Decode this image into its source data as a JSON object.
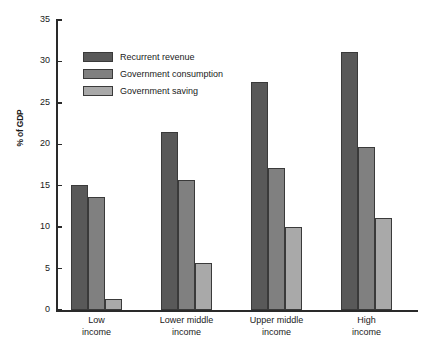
{
  "chart_data": {
    "type": "bar",
    "title": "",
    "xlabel": "",
    "ylabel": "% of GDP",
    "ylim": [
      0,
      35
    ],
    "yticks": [
      0,
      5,
      10,
      15,
      20,
      25,
      30,
      35
    ],
    "grid": false,
    "legend_position": "top-left",
    "categories": [
      "Low income",
      "Lower middle income",
      "Upper middle income",
      "High income"
    ],
    "category_lines": [
      [
        "Low",
        "income"
      ],
      [
        "Lower middle",
        "income"
      ],
      [
        "Upper middle",
        "income"
      ],
      [
        "High",
        "income"
      ]
    ],
    "series": [
      {
        "name": "Recurrent revenue",
        "color": "#595959",
        "values": [
          15.1,
          21.5,
          27.5,
          31.1
        ]
      },
      {
        "name": "Government consumption",
        "color": "#808080",
        "values": [
          13.7,
          15.7,
          17.2,
          19.7
        ]
      },
      {
        "name": "Government saving",
        "color": "#a9a9a9",
        "values": [
          1.3,
          5.7,
          10.0,
          11.1
        ]
      }
    ]
  },
  "axis": {
    "y_tick_labels": [
      "0",
      "5",
      "10",
      "15",
      "20",
      "25",
      "30",
      "35"
    ]
  }
}
